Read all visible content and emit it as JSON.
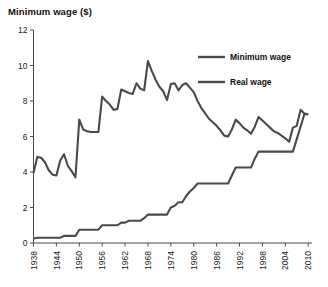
{
  "chart_data": {
    "type": "line",
    "title": "Minimum wage ($)",
    "xlabel": "",
    "ylabel": "Minimum wage ($)",
    "xlim": [
      1938,
      2011
    ],
    "ylim": [
      0,
      12
    ],
    "yticks": [
      0,
      2,
      4,
      6,
      8,
      10,
      12
    ],
    "ytick_labels": [
      "0",
      "2",
      "4",
      "6",
      "8",
      "10",
      "12"
    ],
    "xticks": [
      1938,
      1944,
      1950,
      1956,
      1962,
      1968,
      1974,
      1980,
      1986,
      1992,
      1998,
      2004,
      2010
    ],
    "xtick_labels": [
      "1938",
      "1944",
      "1950",
      "1956",
      "1962",
      "1968",
      "1974",
      "1980",
      "1986",
      "1992",
      "1998",
      "2004",
      "2010"
    ],
    "grid": false,
    "legend_position": "top-right",
    "x": [
      1938,
      1939,
      1940,
      1941,
      1942,
      1943,
      1944,
      1945,
      1946,
      1947,
      1948,
      1949,
      1950,
      1951,
      1952,
      1953,
      1954,
      1955,
      1956,
      1957,
      1958,
      1959,
      1960,
      1961,
      1962,
      1963,
      1964,
      1965,
      1966,
      1967,
      1968,
      1969,
      1970,
      1971,
      1972,
      1973,
      1974,
      1975,
      1976,
      1977,
      1978,
      1979,
      1980,
      1981,
      1982,
      1983,
      1984,
      1985,
      1986,
      1987,
      1988,
      1989,
      1990,
      1991,
      1992,
      1993,
      1994,
      1995,
      1996,
      1997,
      1998,
      1999,
      2000,
      2001,
      2002,
      2003,
      2004,
      2005,
      2006,
      2007,
      2008,
      2009,
      2010
    ],
    "series": [
      {
        "name": "Real wage",
        "color": "#4a4a4a",
        "values": [
          3.95,
          4.85,
          4.8,
          4.55,
          4.1,
          3.85,
          3.8,
          4.65,
          5.0,
          4.35,
          4.05,
          3.7,
          6.95,
          6.4,
          6.3,
          6.25,
          6.25,
          6.25,
          8.25,
          8.0,
          7.8,
          7.5,
          7.55,
          8.65,
          8.55,
          8.45,
          8.4,
          9.0,
          8.7,
          8.6,
          10.25,
          9.7,
          9.2,
          8.8,
          8.55,
          8.05,
          8.95,
          9.0,
          8.6,
          8.9,
          9.0,
          8.75,
          8.5,
          8.0,
          7.6,
          7.3,
          7.0,
          6.8,
          6.6,
          6.35,
          6.05,
          6.0,
          6.4,
          6.95,
          6.75,
          6.5,
          6.35,
          6.15,
          6.55,
          7.1,
          6.9,
          6.7,
          6.5,
          6.3,
          6.2,
          6.05,
          5.9,
          5.7,
          6.5,
          6.6,
          7.5,
          7.3,
          7.25
        ]
      },
      {
        "name": "Minimum wage",
        "color": "#4a4a4a",
        "values": [
          0.25,
          0.3,
          0.3,
          0.3,
          0.3,
          0.3,
          0.3,
          0.3,
          0.4,
          0.4,
          0.4,
          0.4,
          0.75,
          0.75,
          0.75,
          0.75,
          0.75,
          0.75,
          1.0,
          1.0,
          1.0,
          1.0,
          1.0,
          1.15,
          1.15,
          1.25,
          1.25,
          1.25,
          1.25,
          1.4,
          1.6,
          1.6,
          1.6,
          1.6,
          1.6,
          1.6,
          2.0,
          2.1,
          2.3,
          2.3,
          2.65,
          2.9,
          3.1,
          3.35,
          3.35,
          3.35,
          3.35,
          3.35,
          3.35,
          3.35,
          3.35,
          3.35,
          3.8,
          4.25,
          4.25,
          4.25,
          4.25,
          4.25,
          4.75,
          5.15,
          5.15,
          5.15,
          5.15,
          5.15,
          5.15,
          5.15,
          5.15,
          5.15,
          5.15,
          5.85,
          6.55,
          7.25,
          7.25
        ]
      }
    ],
    "legend": [
      {
        "label": "Minimum wage",
        "color": "#4a4a4a"
      },
      {
        "label": "Real wage",
        "color": "#4a4a4a"
      }
    ]
  }
}
